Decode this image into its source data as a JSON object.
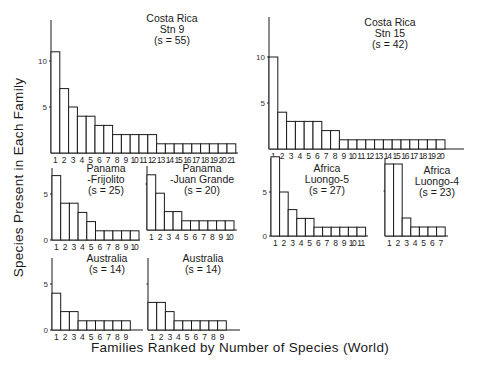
{
  "figure": {
    "ylabel": "Species  Present  in  Each  Family",
    "xlabel": "Families  Ranked  by  Number  of  Species (World)"
  },
  "chart_data": [
    {
      "type": "bar",
      "title": "Costa Rica Stn 9 (s = 55)",
      "title_lines": [
        "Costa Rica",
        "Stn 9",
        "(s = 55)"
      ],
      "categories": [
        "1",
        "2",
        "3",
        "4",
        "5",
        "6",
        "7",
        "8",
        "9",
        "10",
        "11",
        "12",
        "13",
        "14",
        "15",
        "16",
        "17",
        "18",
        "19",
        "20",
        "21"
      ],
      "values": [
        11,
        7,
        5,
        4,
        4,
        3,
        3,
        2,
        2,
        2,
        2,
        2,
        1,
        1,
        1,
        1,
        1,
        1,
        1,
        1,
        1
      ],
      "yticks": [
        5,
        10
      ],
      "xlabel": "Families Ranked by Number of Species (World)",
      "ylabel": "Species Present in Each Family",
      "geom": {
        "ax": 51,
        "base": 153,
        "unit": 9.2,
        "bw": 8.8,
        "top": 20,
        "axis_end": 238,
        "title_x": 172,
        "title_y": 22,
        "show_zero": false
      }
    },
    {
      "type": "bar",
      "title": "Costa Rica Stn 15 (s = 42)",
      "title_lines": [
        "Costa Rica",
        "Stn 15",
        "(s = 42)"
      ],
      "categories": [
        "1",
        "2",
        "3",
        "4",
        "5",
        "6",
        "7",
        "8",
        "9",
        "10",
        "11",
        "12",
        "13",
        "14",
        "15",
        "16",
        "17",
        "18",
        "19",
        "20"
      ],
      "values": [
        10,
        4,
        3,
        3,
        3,
        3,
        2,
        2,
        1,
        1,
        1,
        1,
        1,
        1,
        1,
        1,
        1,
        1,
        1,
        1
      ],
      "yticks": [
        5,
        10
      ],
      "geom": {
        "ax": 269,
        "base": 149,
        "unit": 9.2,
        "bw": 8.8,
        "top": 17,
        "axis_end": 464,
        "title_x": 390,
        "title_y": 26,
        "show_zero": false
      }
    },
    {
      "type": "bar",
      "title": "Panama -Frijolito (s = 25)",
      "title_lines": [
        "Panama",
        "-Frijolito",
        "(s = 25)"
      ],
      "categories": [
        "1",
        "2",
        "3",
        "4",
        "5",
        "6",
        "7",
        "8",
        "9",
        "10"
      ],
      "values": [
        7,
        4,
        4,
        3,
        2,
        1,
        1,
        1,
        1,
        1
      ],
      "yticks": [
        0,
        5
      ],
      "geom": {
        "ax": 52,
        "base": 240,
        "unit": 9.2,
        "bw": 8.7,
        "top": 168,
        "axis_end": 140,
        "title_x": 106,
        "title_y": 172,
        "show_zero": true
      }
    },
    {
      "type": "bar",
      "title": "Panama -Juan Grande (s = 20)",
      "title_lines": [
        "Panama",
        "-Juan Grande",
        "(s = 20)"
      ],
      "categories": [
        "1",
        "2",
        "3",
        "4",
        "5",
        "6",
        "7",
        "8",
        "9",
        "10"
      ],
      "values": [
        6,
        4,
        2,
        2,
        1,
        1,
        1,
        1,
        1,
        1
      ],
      "yticks": [],
      "geom": {
        "ax": 147,
        "base": 230,
        "unit": 9.2,
        "bw": 8.7,
        "top": 166,
        "axis_end": 237,
        "title_x": 202,
        "title_y": 172,
        "show_zero": false,
        "tick_stub": true
      }
    },
    {
      "type": "bar",
      "title": "Africa Luongo-5 (s = 27)",
      "title_lines": [
        "Africa",
        "Luongo-5",
        "(s = 27)"
      ],
      "categories": [
        "1",
        "2",
        "3",
        "4",
        "5",
        "6",
        "7",
        "8",
        "9",
        "10",
        "11"
      ],
      "values": [
        9,
        5,
        3,
        2,
        2,
        1,
        1,
        1,
        1,
        1,
        1
      ],
      "yticks": [
        0,
        5
      ],
      "geom": {
        "ax": 271,
        "base": 236,
        "unit": 8.8,
        "bw": 8.6,
        "top": 158,
        "axis_end": 368,
        "title_x": 327,
        "title_y": 172,
        "show_zero": true
      }
    },
    {
      "type": "bar",
      "title": "Africa Luongo-4 (s = 23)",
      "title_lines": [
        "Africa",
        "Luongo-4",
        "(s = 23)"
      ],
      "categories": [
        "1",
        "2",
        "3",
        "4",
        "5",
        "6",
        "7"
      ],
      "values": [
        8,
        8,
        2,
        1,
        1,
        1,
        1
      ],
      "yticks": [],
      "geom": {
        "ax": 385,
        "base": 236,
        "unit": 9.0,
        "bw": 8.6,
        "top": 158,
        "axis_end": 448,
        "title_x": 437,
        "title_y": 174,
        "show_zero": false,
        "tick_stub": true
      }
    },
    {
      "type": "bar",
      "title": "Australia (s = 14)",
      "title_lines": [
        "Australia",
        "(s = 14)"
      ],
      "categories": [
        "1",
        "2",
        "3",
        "4",
        "5",
        "6",
        "7",
        "8",
        "9"
      ],
      "values": [
        4,
        2,
        2,
        1,
        1,
        1,
        1,
        1,
        1
      ],
      "yticks": [
        0,
        5
      ],
      "geom": {
        "ax": 52,
        "base": 330,
        "unit": 9.2,
        "bw": 8.7,
        "top": 258,
        "axis_end": 143,
        "title_x": 107,
        "title_y": 262,
        "show_zero": true
      }
    },
    {
      "type": "bar",
      "title": "Australia (s = 14)",
      "title_lines": [
        "Australia",
        "(s = 14)"
      ],
      "categories": [
        "1",
        "2",
        "3",
        "4",
        "5",
        "6",
        "7",
        "8",
        "9"
      ],
      "values": [
        3,
        3,
        2,
        1,
        1,
        1,
        1,
        1,
        1
      ],
      "yticks": [],
      "geom": {
        "ax": 148,
        "base": 330,
        "unit": 9.2,
        "bw": 8.7,
        "top": 258,
        "axis_end": 240,
        "title_x": 203,
        "title_y": 262,
        "show_zero": false,
        "tick_stub": true
      }
    }
  ]
}
